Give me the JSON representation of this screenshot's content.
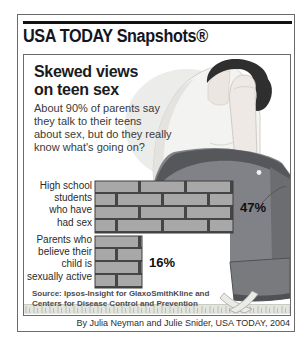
{
  "masthead": {
    "title": "USA TODAY Snapshots®"
  },
  "infographic": {
    "headline": "Skewed views\non teen sex",
    "intro": "About 90% of parents say they talk to their teens about sex, but do they really know what's going on?",
    "source": "Source: Ipsos-Insight for GlaxoSmithKline and\nCenters for Disease Control and Prevention",
    "credit": "By Julia Neyman and Julie Snider, USA TODAY, 2004"
  },
  "chart_data": {
    "type": "bar",
    "orientation": "horizontal",
    "title": "Skewed views on teen sex",
    "categories": [
      "High school students who have had sex",
      "Parents who believe their child is sexually active"
    ],
    "values": [
      47,
      16
    ],
    "unit": "%",
    "value_labels": [
      "47%",
      "16%"
    ],
    "display_labels": [
      "High school\nstudents\nwho have\nhad sex",
      "Parents who\nbelieve their\nchild is\nsexually active"
    ],
    "xlim": [
      0,
      50
    ],
    "grid": false,
    "legend": false,
    "bar_style": "brick-wall",
    "colors": {
      "brick": "#a8a8a8",
      "mortar": "#454545",
      "value_text": "#101010"
    }
  }
}
